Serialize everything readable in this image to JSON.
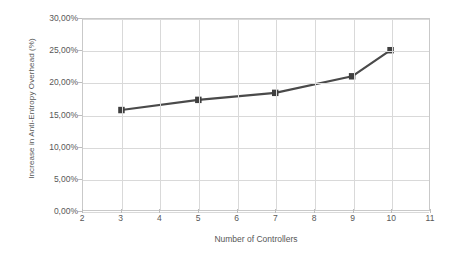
{
  "chart_data": {
    "type": "line",
    "title": "",
    "xlabel": "Number of Controllers",
    "ylabel": "Increase in Anti-Entropy Overhead (%)",
    "x": [
      3,
      5,
      7,
      9,
      10
    ],
    "values": [
      15.7,
      17.3,
      18.4,
      21.0,
      25.1
    ],
    "series": [
      {
        "name": "Increase in Anti-Entropy Overhead (%)",
        "x": [
          3,
          5,
          7,
          9,
          10
        ],
        "values": [
          15.7,
          17.3,
          18.4,
          21.0,
          25.1
        ]
      }
    ],
    "xlim": [
      2,
      11
    ],
    "ylim": [
      0,
      30
    ],
    "x_tick_labels": [
      "2",
      "3",
      "4",
      "5",
      "6",
      "7",
      "8",
      "9",
      "10",
      "11"
    ],
    "x_ticks": [
      2,
      3,
      4,
      5,
      6,
      7,
      8,
      9,
      10,
      11
    ],
    "y_tick_labels": [
      "0,00%",
      "5,00%",
      "10,00%",
      "15,00%",
      "20,00%",
      "25,00%",
      "30,00%"
    ],
    "y_ticks": [
      0,
      5,
      10,
      15,
      20,
      25,
      30
    ],
    "grid": true,
    "legend": false,
    "legend_position": "none",
    "marker": "square",
    "colors": {
      "line": "#4a4a4a",
      "marker": "#3f3f3f",
      "grid": "#d9d9d9",
      "axis": "#c9c9c9",
      "text": "#585858",
      "background": "#ffffff"
    }
  }
}
